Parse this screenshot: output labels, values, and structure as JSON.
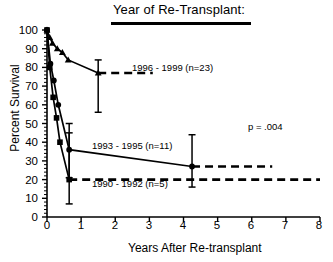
{
  "chart_data": {
    "type": "line",
    "title": "Year of Re-Transplant:",
    "xlabel": "Years After Re-transplant",
    "ylabel": "Percent Survival",
    "xlim": [
      0,
      8
    ],
    "ylim": [
      0,
      100
    ],
    "xticks": [
      "0",
      "1",
      "2",
      "3",
      "4",
      "5",
      "6",
      "7",
      "8"
    ],
    "yticks": [
      "0",
      "10",
      "20",
      "30",
      "40",
      "50",
      "60",
      "70",
      "80",
      "90",
      "100"
    ],
    "grid": false,
    "legend_position": "inline-annotations",
    "annotations": {
      "p_value": "p = .004"
    },
    "series": [
      {
        "name": "1996 - 1999 (n=23)",
        "label": "1996 - 1999 (n=23)",
        "n": 23,
        "marker": "triangle",
        "x": [
          0.0,
          0.08,
          0.16,
          0.3,
          0.45,
          0.62,
          1.5
        ],
        "y": [
          100,
          96,
          93,
          90,
          88,
          84,
          77
        ],
        "error_bars": [
          {
            "x": 1.5,
            "y": 77,
            "low": 56,
            "high": 84
          }
        ],
        "dashed_extension": {
          "from_x": 1.5,
          "to_x": 3.1,
          "y": 77
        }
      },
      {
        "name": "1993 - 1995 (n=11)",
        "label": "1993 - 1995 (n=11)",
        "n": 11,
        "marker": "circle",
        "x": [
          0.0,
          0.1,
          0.2,
          0.33,
          0.65,
          4.25
        ],
        "y": [
          100,
          82,
          73,
          60,
          36,
          27
        ],
        "error_bars": [
          {
            "x": 0.65,
            "y": 36,
            "low": 21,
            "high": 50
          },
          {
            "x": 4.25,
            "y": 27,
            "low": 16,
            "high": 44
          }
        ],
        "dashed_extension": {
          "from_x": 4.25,
          "to_x": 6.6,
          "y": 27
        }
      },
      {
        "name": "1990 - 1992 (n=5)",
        "label": "1990 - 1992 (n=5)",
        "n": 5,
        "marker": "square",
        "x": [
          0.0,
          0.08,
          0.18,
          0.28,
          0.38,
          0.65
        ],
        "y": [
          100,
          80,
          64,
          53,
          40,
          20
        ],
        "error_bars": [
          {
            "x": 0.65,
            "y": 20,
            "low": 7,
            "high": 45
          }
        ],
        "dashed_extension": {
          "from_x": 0.65,
          "to_x": 8.0,
          "y": 20
        }
      }
    ]
  }
}
